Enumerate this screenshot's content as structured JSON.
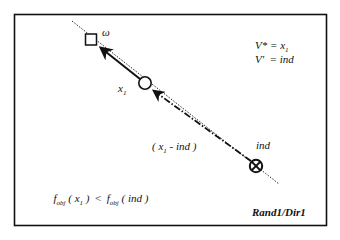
{
  "diagram": {
    "title_tag": "Rand1/Dir1",
    "nodes": {
      "omega": {
        "label": "ω",
        "shape": "square"
      },
      "x1": {
        "label": "x",
        "subscript": "1",
        "shape": "circle"
      },
      "ind": {
        "label": "ind",
        "shape": "circle-cross"
      }
    },
    "edges": {
      "x1_to_omega": {
        "style": "solid-arrow"
      },
      "ind_to_x1": {
        "style": "dash-dot-arrow",
        "label_open": "( x",
        "label_sub": "1",
        "label_rest": " - ind )"
      },
      "base_line": {
        "style": "dotted"
      }
    },
    "legend": {
      "line1_lhs": "V* = x",
      "line1_sub": "1",
      "line2": "V'  = ind"
    },
    "condition": {
      "f1": "f",
      "f1_sub": "obj",
      "arg1_open": " ( x",
      "arg1_sub": "1",
      "arg1_close": " )",
      "op": "  <  ",
      "f2": "f",
      "f2_sub": "obj",
      "arg2": " ( ind )"
    },
    "colors": {
      "stroke": "#111111",
      "background": "#ffffff"
    }
  }
}
